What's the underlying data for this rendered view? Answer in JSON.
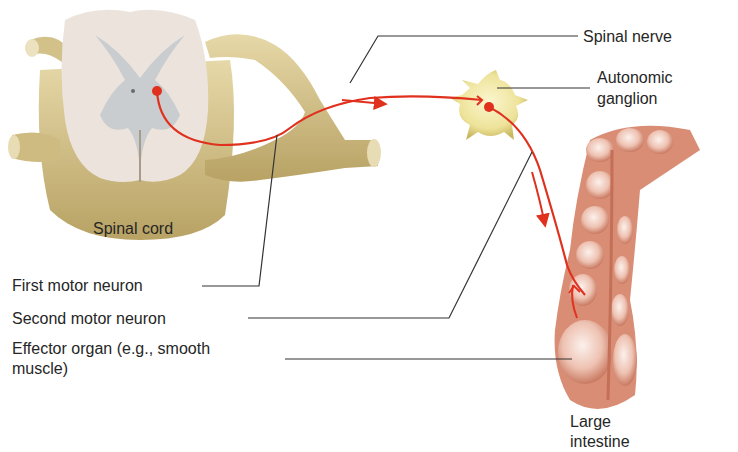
{
  "labels": {
    "spinal_nerve": "Spinal nerve",
    "autonomic_ganglion_line1": "Autonomic",
    "autonomic_ganglion_line2": "ganglion",
    "spinal_cord": "Spinal cord",
    "first_motor_neuron": "First motor neuron",
    "second_motor_neuron": "Second motor neuron",
    "effector_organ_line1": "Effector organ (e.g., smooth",
    "effector_organ_line2": "muscle)",
    "large_intestine_line1": "Large",
    "large_intestine_line2": "intestine"
  },
  "colors": {
    "neuron": "#e0301e",
    "nerve": "#c9b57a",
    "cord_white": "#ece4dc",
    "cord_gray": "#c9cdd0",
    "ganglion": "#eee39a",
    "intestine": "#d98d74",
    "leader_line": "#333333"
  }
}
